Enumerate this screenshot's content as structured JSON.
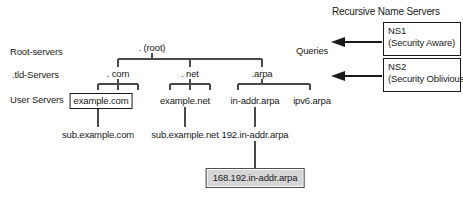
{
  "diagram": {
    "title_right": "Recursive Name Servers",
    "queries_label": "Queries",
    "row_labels": {
      "root": "Root-servers",
      "tld": ".tld-Servers",
      "user": "User Servers"
    },
    "tree": {
      "root": ". (root)",
      "tlds": [
        {
          "label": ". com"
        },
        {
          "label": ". net"
        },
        {
          "label": ".arpa"
        }
      ],
      "second_level": [
        {
          "label": "example.com",
          "boxed": "yes"
        },
        {
          "label": "example.net",
          "boxed": "no"
        },
        {
          "label": "in-addr.arpa",
          "boxed": "no"
        },
        {
          "label": "ipv6.arpa",
          "boxed": "no"
        }
      ],
      "third_level": [
        {
          "label": "sub.example.com"
        },
        {
          "label": "sub.example.net"
        },
        {
          "label": "192.in-addr.arpa"
        }
      ],
      "fourth_level": [
        {
          "label": "168.192.in-addr.arpa"
        }
      ]
    },
    "name_servers": [
      {
        "name": "NS1",
        "note": "(Security Aware)"
      },
      {
        "name": "NS2",
        "note": "(Security Oblivious)"
      }
    ],
    "colors": {
      "line": "#4a4a4a",
      "text": "#1a1a1a",
      "shaded_fill": "#d6d6d6",
      "background": "#ffffff"
    }
  }
}
